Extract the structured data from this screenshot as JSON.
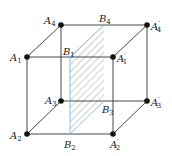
{
  "figure": {
    "type": "cube-with-section-plane",
    "colors": {
      "edge": "#333333",
      "plane_border": "#7fb3d5",
      "hatch": "#555555",
      "vertex": "#111111"
    },
    "vertices": [
      {
        "id": "A1",
        "base": "A",
        "sub": "1",
        "prime": "",
        "x": 27,
        "y": 57
      },
      {
        "id": "A2",
        "base": "A",
        "sub": "2",
        "prime": "",
        "x": 27,
        "y": 134
      },
      {
        "id": "A3",
        "base": "A",
        "sub": "3",
        "prime": "",
        "x": 61,
        "y": 101
      },
      {
        "id": "A4",
        "base": "A",
        "sub": "4",
        "prime": "",
        "x": 61,
        "y": 25
      },
      {
        "id": "A1p",
        "base": "A",
        "sub": "1",
        "prime": "′",
        "x": 113,
        "y": 57
      },
      {
        "id": "A2p",
        "base": "A",
        "sub": "2",
        "prime": "′",
        "x": 113,
        "y": 134
      },
      {
        "id": "A3p",
        "base": "A",
        "sub": "3",
        "prime": "′",
        "x": 147,
        "y": 101
      },
      {
        "id": "A4p",
        "base": "A",
        "sub": "4",
        "prime": "′",
        "x": 147,
        "y": 25
      }
    ],
    "section_points": [
      {
        "id": "B1",
        "base": "B",
        "sub": "1",
        "x": 70,
        "y": 57
      },
      {
        "id": "B2",
        "base": "B",
        "sub": "2",
        "x": 70,
        "y": 134
      },
      {
        "id": "B3",
        "base": "B",
        "sub": "3",
        "x": 104,
        "y": 101
      },
      {
        "id": "B4",
        "base": "B",
        "sub": "4",
        "x": 104,
        "y": 25
      }
    ],
    "labels": {
      "A1": {
        "base": "A",
        "sub": "1",
        "prime": ""
      },
      "A2": {
        "base": "A",
        "sub": "2",
        "prime": ""
      },
      "A3": {
        "base": "A",
        "sub": "3",
        "prime": ""
      },
      "A4": {
        "base": "A",
        "sub": "4",
        "prime": ""
      },
      "A1p": {
        "base": "A",
        "sub": "1",
        "prime": "′"
      },
      "A2p": {
        "base": "A",
        "sub": "2",
        "prime": "′"
      },
      "A3p": {
        "base": "A",
        "sub": "3",
        "prime": "′"
      },
      "A4p": {
        "base": "A",
        "sub": "4",
        "prime": "′"
      },
      "B1": {
        "base": "B",
        "sub": "1"
      },
      "B2": {
        "base": "B",
        "sub": "2"
      },
      "B3": {
        "base": "B",
        "sub": "3"
      },
      "B4": {
        "base": "B",
        "sub": "4"
      }
    }
  }
}
